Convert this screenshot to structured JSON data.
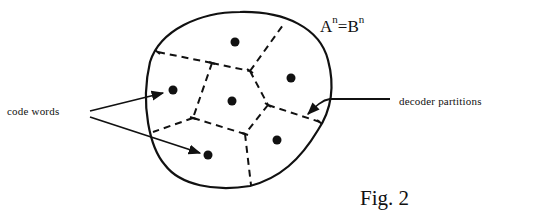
{
  "figure": {
    "caption": "Fig. 2",
    "set_label": {
      "left_base": "A",
      "right_base": "B",
      "exponent": "n",
      "equals": "="
    },
    "labels": {
      "code_words": "code words",
      "decoder_partitions": "decoder partitions"
    },
    "elements": {
      "region": "outer blob representing the set A^n = B^n",
      "code_word_count": 6,
      "partition_count": 6,
      "partition_style": "dashed",
      "arrows": [
        "code words → left code word",
        "code words → bottom code word",
        "decoder partitions → right boundary"
      ]
    },
    "colors": {
      "ink": "#111111",
      "background": "#ffffff"
    }
  }
}
